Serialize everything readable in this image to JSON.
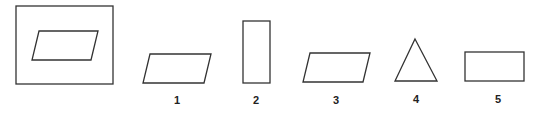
{
  "figure": {
    "reference": {
      "description": "Parallelogram inside a square frame"
    },
    "options": [
      {
        "label": "1",
        "shape": "parallelogram"
      },
      {
        "label": "2",
        "shape": "tall rectangle"
      },
      {
        "label": "3",
        "shape": "parallelogram"
      },
      {
        "label": "4",
        "shape": "triangle"
      },
      {
        "label": "5",
        "shape": "rectangle"
      }
    ],
    "stroke_color": "#333333"
  }
}
